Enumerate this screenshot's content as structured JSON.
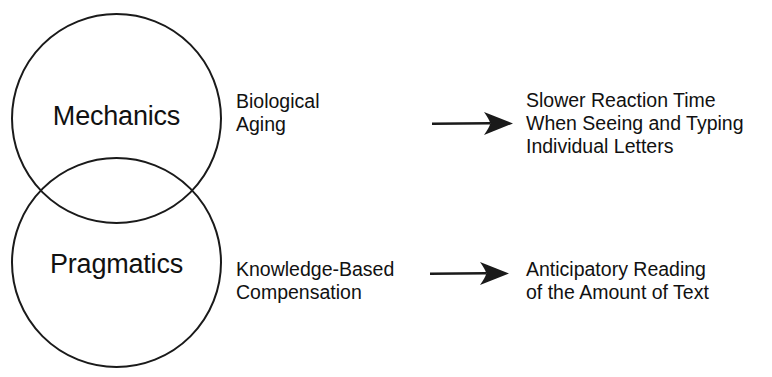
{
  "figure": {
    "type": "venn-flow-diagram",
    "background_color": "#ffffff",
    "ink_color": "#1a1a1a"
  },
  "venn": {
    "circles": [
      {
        "id": "mechanics",
        "label": "Mechanics"
      },
      {
        "id": "pragmatics",
        "label": "Pragmatics"
      }
    ]
  },
  "mediators": {
    "mechanics": {
      "line1": "Biological",
      "line2": "Aging"
    },
    "pragmatics": {
      "line1": "Knowledge-Based",
      "line2": "Compensation"
    }
  },
  "arrows": {
    "top": {
      "icon": "right-arrow-icon",
      "direction": "right"
    },
    "bottom": {
      "icon": "right-arrow-icon",
      "direction": "right"
    }
  },
  "outcomes": {
    "mechanics": {
      "line1": "Slower Reaction Time",
      "line2": "When Seeing and Typing",
      "line3": "Individual Letters"
    },
    "pragmatics": {
      "line1": "Anticipatory Reading",
      "line2": "of the Amount of Text"
    }
  }
}
